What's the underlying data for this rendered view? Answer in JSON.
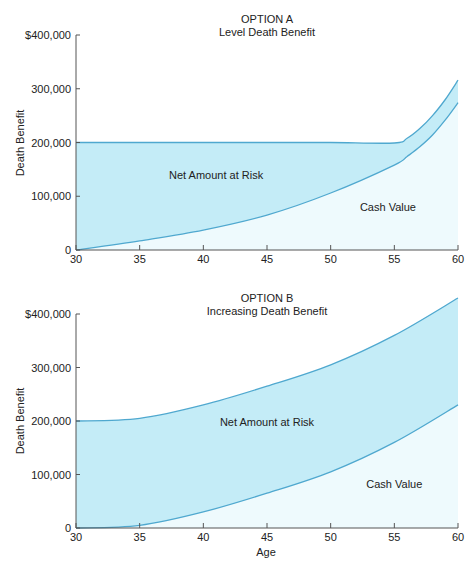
{
  "chart_data": [
    {
      "type": "area",
      "title": "OPTION A",
      "subtitle": "Level Death Benefit",
      "xlabel": "",
      "ylabel": "Death Benefit",
      "x": [
        30,
        35,
        40,
        45,
        50,
        55,
        56,
        57,
        58,
        59,
        60
      ],
      "series": [
        {
          "name": "Death Benefit",
          "values": [
            200000,
            200000,
            200000,
            200000,
            200000,
            199000,
            208000,
            226000,
            250000,
            280000,
            316000
          ]
        },
        {
          "name": "Cash Value",
          "values": [
            0,
            17000,
            37000,
            65000,
            106000,
            158000,
            174000,
            192000,
            214000,
            242000,
            274000
          ]
        }
      ],
      "regions": [
        {
          "label": "Net Amount at Risk",
          "x": 41,
          "y": 132000
        },
        {
          "label": "Cash Value",
          "x": 54.5,
          "y": 72000
        }
      ],
      "xticks": [
        30,
        35,
        40,
        45,
        50,
        55,
        60
      ],
      "yticks": [
        0,
        100000,
        200000,
        300000,
        400000
      ],
      "ytick_labels": [
        "0",
        "100,000",
        "200,000",
        "300,000",
        "$400,000"
      ],
      "xlim": [
        30,
        60
      ],
      "ylim": [
        0,
        400000
      ],
      "grid": false,
      "legend": "none"
    },
    {
      "type": "area",
      "title": "OPTION B",
      "subtitle": "Increasing Death Benefit",
      "xlabel": "Age",
      "ylabel": "Death Benefit",
      "x": [
        30,
        35,
        40,
        45,
        50,
        55,
        60
      ],
      "series": [
        {
          "name": "Death Benefit",
          "values": [
            200000,
            205000,
            230000,
            265000,
            305000,
            360000,
            430000
          ]
        },
        {
          "name": "Cash Value",
          "values": [
            0,
            5000,
            30000,
            65000,
            105000,
            160000,
            230000
          ]
        }
      ],
      "regions": [
        {
          "label": "Net Amount at Risk",
          "x": 45,
          "y": 190000
        },
        {
          "label": "Cash Value",
          "x": 55,
          "y": 75000
        }
      ],
      "xticks": [
        30,
        35,
        40,
        45,
        50,
        55,
        60
      ],
      "yticks": [
        0,
        100000,
        200000,
        300000,
        400000
      ],
      "ytick_labels": [
        "0",
        "100,000",
        "200,000",
        "300,000",
        "$400,000"
      ],
      "xlim": [
        30,
        60
      ],
      "ylim": [
        0,
        400000
      ],
      "grid": false,
      "legend": "none"
    }
  ],
  "colors": {
    "net_amount_at_risk_fill": "#c4ecf7",
    "cash_value_fill": "#eefafd",
    "curve_stroke": "#4fa8cf",
    "axis": "#555555"
  }
}
